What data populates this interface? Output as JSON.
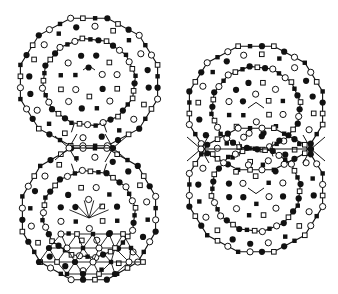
{
  "diagram": {
    "width": 338,
    "height": 294,
    "stroke_color": "#111111",
    "fill_color": "#111111",
    "open_fill": "#ffffff",
    "marker_types": [
      "filled-circle",
      "open-circle",
      "filled-square",
      "open-square"
    ],
    "figures": [
      {
        "name": "left-figure",
        "lobes": [
          {
            "name": "left-top-lobe",
            "cx": 89,
            "cy": 82,
            "outer_rx": 71,
            "outer_ry": 66,
            "inner_rx": 47,
            "inner_ry": 44,
            "outer_sides": 12,
            "inner_sides": 12,
            "rot": 0
          },
          {
            "name": "left-bottom-lobe",
            "cx": 89,
            "cy": 214,
            "outer_rx": 69,
            "outer_ry": 68,
            "inner_rx": 47,
            "inner_ry": 44,
            "outer_sides": 12,
            "inner_sides": 12,
            "rot": 0
          }
        ],
        "junction": {
          "y": 148,
          "x1": 69,
          "x2": 113
        },
        "center_marks": [
          {
            "type": "caret",
            "x": 89,
            "y": 70,
            "size": 6
          }
        ],
        "bottom_mesh": true
      },
      {
        "name": "right-figure",
        "lobes": [
          {
            "name": "right-top-lobe",
            "cx": 256,
            "cy": 108,
            "outer_rx": 69,
            "outer_ry": 64,
            "inner_rx": 45,
            "inner_ry": 42,
            "outer_sides": 12,
            "inner_sides": 12,
            "rot": 0
          },
          {
            "name": "right-bottom-lobe",
            "cx": 256,
            "cy": 190,
            "outer_rx": 69,
            "outer_ry": 64,
            "inner_rx": 45,
            "inner_ry": 42,
            "outer_sides": 12,
            "inner_sides": 12,
            "rot": 0
          }
        ],
        "junction": {
          "y": 149,
          "x1": 201,
          "x2": 311
        },
        "center_marks": [
          {
            "type": "caret",
            "x": 256,
            "y": 108,
            "size": 8
          },
          {
            "type": "vee",
            "x": 256,
            "y": 188,
            "size": 8
          }
        ],
        "bottom_mesh": false
      }
    ],
    "vertex_pattern": [
      1,
      3,
      2,
      0,
      3,
      0,
      1,
      2
    ],
    "dot_pattern": [
      0,
      3,
      1,
      2,
      0,
      1,
      3,
      2,
      1,
      0
    ]
  }
}
